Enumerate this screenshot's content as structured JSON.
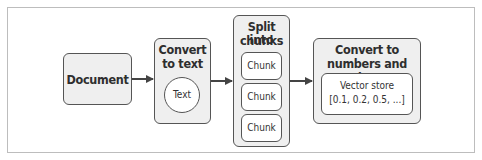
{
  "diagram": {
    "nodes": [
      {
        "id": "document",
        "label": "Document"
      },
      {
        "id": "convert_text",
        "title_line1": "Convert",
        "title_line2": "to text",
        "child": "Text"
      },
      {
        "id": "split",
        "title_line1": "Split into",
        "title_line2": "chunks",
        "children": [
          "Chunk",
          "Chunk",
          "Chunk"
        ]
      },
      {
        "id": "convert_numbers",
        "title_line1": "Convert to",
        "title_line2": "numbers and store",
        "child_line1": "Vector store",
        "child_line2": "[0.1, 0.2, 0.5, ...]"
      }
    ],
    "edges": [
      {
        "from": "document",
        "to": "convert_text"
      },
      {
        "from": "convert_text",
        "to": "split"
      },
      {
        "from": "split",
        "to": "convert_numbers"
      }
    ],
    "colors": {
      "box_fill": "#efefef",
      "stroke": "#555555",
      "frame": "#bdbdbd"
    }
  }
}
